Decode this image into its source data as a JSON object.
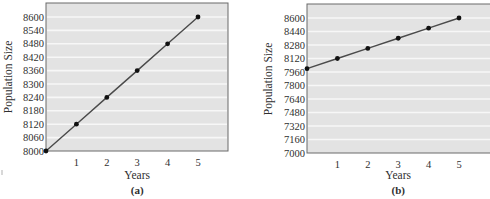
{
  "chart_data": [
    {
      "type": "line",
      "id": "a",
      "caption": "(a)",
      "title": "",
      "xlabel": "Years",
      "ylabel": "Population Size",
      "x": [
        0,
        1,
        2,
        3,
        4,
        5
      ],
      "x_tick_labels": [
        "1",
        "2",
        "3",
        "4",
        "5"
      ],
      "series": [
        {
          "name": "Population",
          "values": [
            8000,
            8120,
            8240,
            8360,
            8480,
            8600
          ]
        }
      ],
      "y_tick_labels": [
        "8000",
        "8060",
        "8120",
        "8180",
        "8240",
        "8300",
        "8360",
        "8420",
        "8480",
        "8540",
        "8600"
      ],
      "ylim": [
        8000,
        8640
      ],
      "xlim": [
        0,
        6
      ],
      "grid": "horizontal",
      "legend": "none"
    },
    {
      "type": "line",
      "id": "b",
      "caption": "(b)",
      "title": "",
      "xlabel": "Years",
      "ylabel": "Population Size",
      "x": [
        0,
        1,
        2,
        3,
        4,
        5
      ],
      "x_tick_labels": [
        "1",
        "2",
        "3",
        "4",
        "5"
      ],
      "series": [
        {
          "name": "Population",
          "values": [
            8000,
            8120,
            8240,
            8360,
            8480,
            8600
          ]
        }
      ],
      "y_tick_labels": [
        "7000",
        "7160",
        "7320",
        "7480",
        "7640",
        "7800",
        "7960",
        "8120",
        "8280",
        "8440",
        "8600"
      ],
      "ylim": [
        7000,
        8760
      ],
      "xlim": [
        0,
        6
      ],
      "grid": "horizontal",
      "legend": "none"
    }
  ],
  "style": {
    "plot_background": "#e3e3e3",
    "grid_color": "#f7f7f7",
    "frame_color": "#6a6a6a",
    "line_color": "#4a4a4a",
    "marker_color": "#111111"
  }
}
